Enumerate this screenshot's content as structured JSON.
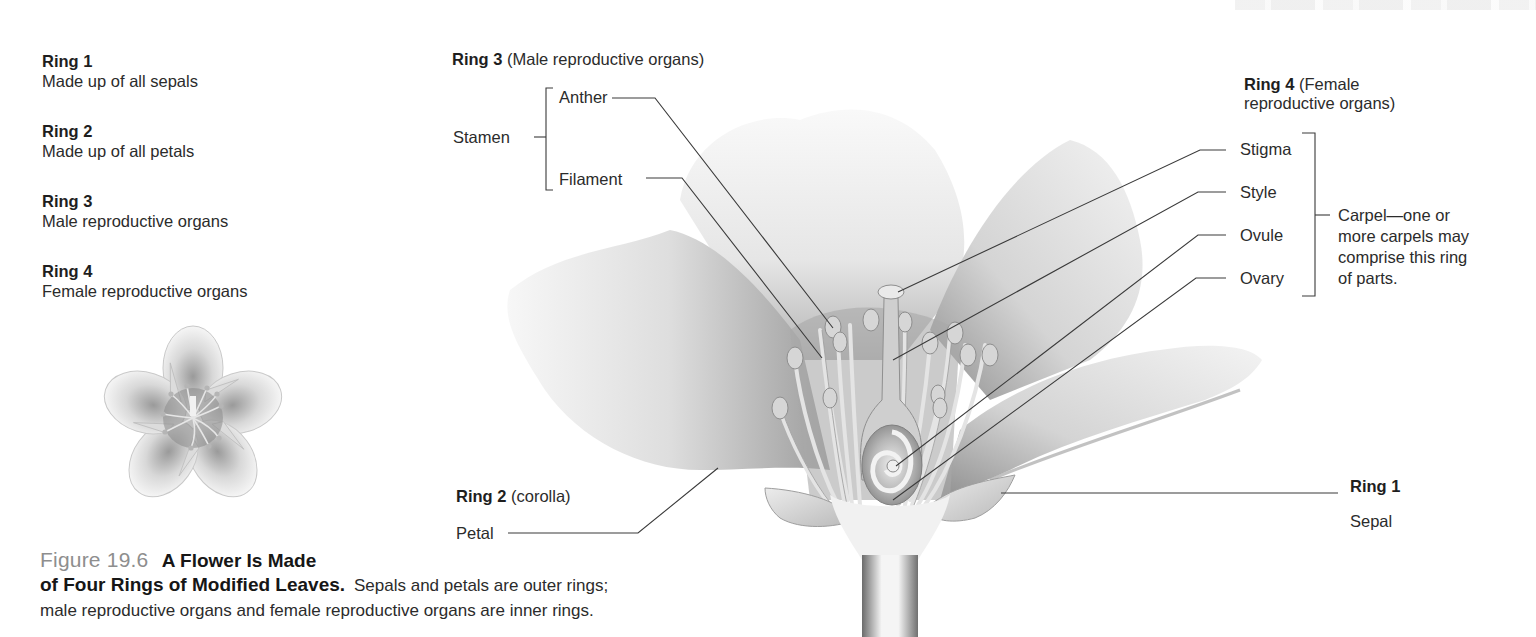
{
  "legend": [
    {
      "title": "Ring 1",
      "desc": "Made up of all sepals"
    },
    {
      "title": "Ring 2",
      "desc": "Made up of all petals"
    },
    {
      "title": "Ring 3",
      "desc": "Male reproductive organs"
    },
    {
      "title": "Ring 4",
      "desc": "Female reproductive organs"
    }
  ],
  "diagram": {
    "ring3": {
      "title": "Ring 3",
      "subtitle": "(Male reproductive organs)"
    },
    "stamen": {
      "group": "Stamen",
      "parts": [
        "Anther",
        "Filament"
      ]
    },
    "ring4": {
      "title": "Ring 4",
      "subtitle_line1": "(Female",
      "subtitle_line2": "reproductive organs)"
    },
    "carpel": {
      "parts": [
        "Stigma",
        "Style",
        "Ovule",
        "Ovary"
      ],
      "note_lines": [
        "Carpel—one or",
        "more carpels may",
        "comprise this ring",
        "of parts."
      ]
    },
    "ring2": {
      "title": "Ring 2",
      "subtitle": "(corolla)",
      "part": "Petal"
    },
    "ring1": {
      "title": "Ring 1",
      "part": "Sepal"
    }
  },
  "caption": {
    "figure_number": "Figure 19.6",
    "title_line1": "A Flower Is Made",
    "title_line2": "of Four Rings of Modified Leaves.",
    "body_line1": "Sepals and petals are outer rings;",
    "body_line2": "male reproductive organs and female reproductive organs are inner rings."
  },
  "colors": {
    "text": "#2b2b2b",
    "figure_number": "#8e8e8e",
    "leader_line": "#3a3a3a",
    "petal_light": "#f4f4f4",
    "petal_shade": "#a8a8a8"
  }
}
